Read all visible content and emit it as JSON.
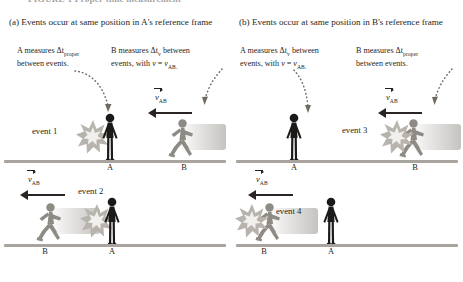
{
  "figure": {
    "title": "FIGURE 1  Proper time measurement"
  },
  "colors": {
    "ink": "#231f1c",
    "ground": "#a9a49d",
    "person_a": "#1c1a18",
    "person_b": "#8e8a84",
    "burst_fill": "#b8b4ad",
    "burst_core": "#f2f0ec",
    "leader": "#6f6a64"
  },
  "panels": [
    {
      "id": "a",
      "header": "(a) Events occur at same position in A's reference frame",
      "notes": [
        {
          "id": "a-note-left",
          "lines": [
            "A measures Δt",
            "between events."
          ],
          "sub": "proper"
        },
        {
          "id": "a-note-right",
          "lines": [
            "B measures Δt",
            "events, with v = v"
          ],
          "sub": "v",
          "sub2": "AB."
        }
      ],
      "note_left_text": "A measures Δtproper between events.",
      "note_right_text": "B measures Δtv between events, with v = vAB.",
      "rows": [
        {
          "id": "a-row-1",
          "event_label": "event 1",
          "velocity_label": "vAB",
          "left_person": "A",
          "right_person": "B",
          "ground_labels": [
            "A",
            "B"
          ]
        },
        {
          "id": "a-row-2",
          "event_label": "event 2",
          "velocity_label": "vAB",
          "left_person": "B",
          "right_person": "A",
          "ground_labels": [
            "B",
            "A"
          ]
        }
      ]
    },
    {
      "id": "b",
      "header": "(b) Events occur at same position in B's reference frame",
      "note_left_text": "A measures Δtv between events, with v = vAB.",
      "note_right_text": "B measures Δtproper between events.",
      "rows": [
        {
          "id": "b-row-1",
          "event_label": "event 3",
          "velocity_label": "vAB",
          "left_person": "A",
          "right_person": "B",
          "ground_labels": [
            "A",
            "B"
          ]
        },
        {
          "id": "b-row-2",
          "event_label": "event 4",
          "velocity_label": "vAB",
          "left_person": "B",
          "right_person": "A",
          "ground_labels": [
            "B",
            "A"
          ]
        }
      ]
    }
  ],
  "text": {
    "a_header": "(a) Events occur at same position in A's reference frame",
    "b_header": "(b) Events occur at same position in B's reference frame",
    "a_note_left_pre": "A measures Δt",
    "a_note_left_sub": "proper",
    "a_note_left_post": "between events.",
    "a_note_right_pre": "B measures Δt",
    "a_note_right_sub": "v",
    "a_note_right_mid": "between events, with ",
    "a_note_right_v": "v",
    "a_note_right_eq": " = ",
    "a_note_right_v2": "v",
    "a_note_right_sub2": "AB.",
    "b_note_left_pre": "A measures Δt",
    "b_note_left_sub": "v",
    "b_note_left_mid": "between events, with ",
    "b_note_left_v": "v",
    "b_note_left_eq": " = ",
    "b_note_left_v2": "v",
    "b_note_left_sub2": "AB.",
    "b_note_right_pre": "B measures Δt",
    "b_note_right_sub": "proper",
    "b_note_right_post": "between events.",
    "event1": "event 1",
    "event2": "event 2",
    "event3": "event 3",
    "event4": "event 4",
    "v_symbol": "v",
    "v_sub": "AB",
    "label_A": "A",
    "label_B": "B"
  }
}
